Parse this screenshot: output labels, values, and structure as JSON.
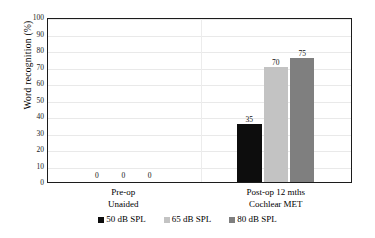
{
  "chart_data": {
    "type": "bar",
    "title": "",
    "subtitle": "",
    "xlabel": "",
    "ylabel": "Word recognition (%)",
    "ylim": [
      0,
      100
    ],
    "ytick_step": 10,
    "ytick_labels": [
      "100",
      "90",
      "80",
      "70",
      "60",
      "50",
      "40",
      "30",
      "20",
      "10",
      "0"
    ],
    "grid": true,
    "legend_position": "bottom",
    "categories": [
      "Pre-op\nUnaided",
      "Post-op 12 mths\nCochlear MET"
    ],
    "category_lines": [
      [
        "Pre-op",
        "Unaided"
      ],
      [
        "Post-op 12 mths",
        "Cochlear MET"
      ]
    ],
    "series": [
      {
        "name": "50 dB SPL",
        "color": "#0d0d0d",
        "values": [
          0,
          35
        ],
        "labels": [
          "0",
          "35"
        ]
      },
      {
        "name": "65 dB SPL",
        "color": "#c3c3c3",
        "values": [
          0,
          70
        ],
        "labels": [
          "0",
          "70"
        ]
      },
      {
        "name": "80 dB SPL",
        "color": "#7f7f7f",
        "values": [
          0,
          75
        ],
        "labels": [
          "0",
          "75"
        ]
      }
    ],
    "data_labels": [
      "0",
      "0",
      "0",
      "35",
      "70",
      "75"
    ],
    "axis_color": "#1c1c1c",
    "gridline_color": "#e9e9e9",
    "plot_background": "#ffffff"
  },
  "legend": {
    "items": [
      {
        "label": "50 dB SPL",
        "color": "#0d0d0d"
      },
      {
        "label": "65 dB SPL",
        "color": "#c3c3c3"
      },
      {
        "label": "80 dB SPL",
        "color": "#7f7f7f"
      }
    ]
  }
}
